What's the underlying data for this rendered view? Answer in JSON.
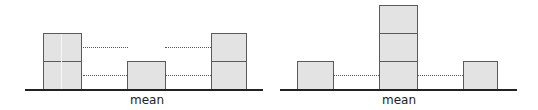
{
  "colors": {
    "block_fill": "#e3e3e3",
    "block_border": "#5a5a5a",
    "baseline": "#222222",
    "dotted": "#555555"
  },
  "diagrams": [
    {
      "name": "left",
      "label": "mean",
      "description": "Two stacks of 2 units on either side, 1 unit at the mean",
      "stacks": [
        {
          "position": "left",
          "units": 2
        },
        {
          "position": "mean",
          "units": 1
        },
        {
          "position": "right",
          "units": 2
        }
      ]
    },
    {
      "name": "right",
      "label": "mean",
      "description": "Stacks of 1 unit on either side, 3 units at the mean",
      "stacks": [
        {
          "position": "left",
          "units": 1
        },
        {
          "position": "mean",
          "units": 3
        },
        {
          "position": "right",
          "units": 1
        }
      ]
    }
  ]
}
